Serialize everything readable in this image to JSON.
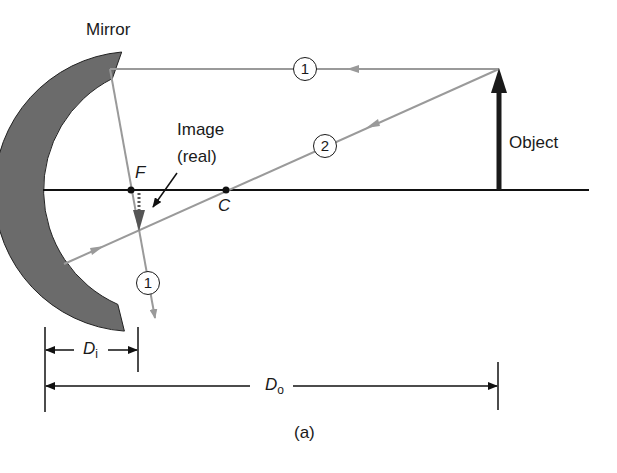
{
  "labels": {
    "mirror": "Mirror",
    "image_line1": "Image",
    "image_line2": "(real)",
    "focal_point": "F",
    "center_curvature": "C",
    "object": "Object",
    "ray1_top": "1",
    "ray1_bottom": "1",
    "ray2": "2",
    "di_main": "D",
    "di_sub": "i",
    "do_main": "D",
    "do_sub": "o",
    "caption": "(a)"
  },
  "colors": {
    "mirror_fill": "#6b6b6b",
    "ray": "#9a9a9a",
    "axis": "#111111",
    "object": "#1a1a1a",
    "image": "#555555"
  }
}
